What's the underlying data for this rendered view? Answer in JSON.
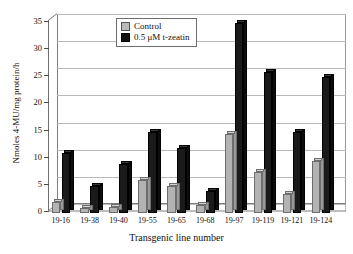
{
  "chart_data": {
    "type": "bar",
    "title": "",
    "xlabel": "Transgenic line number",
    "ylabel": "Nmoles 4-MU/mg protein/h",
    "ylim": [
      0,
      35
    ],
    "yticks": [
      0,
      5,
      10,
      15,
      20,
      25,
      30,
      35
    ],
    "grid": true,
    "legend_position": "top-center",
    "categories": [
      "19-16",
      "19-38",
      "19-40",
      "19-55",
      "19-65",
      "19-68",
      "19-97",
      "19-119",
      "19-121",
      "19-124"
    ],
    "series": [
      {
        "name": "Control",
        "color": "#b3b3b3",
        "values": [
          2.0,
          1.0,
          1.2,
          6.0,
          5.0,
          1.5,
          14.5,
          7.5,
          3.5,
          9.5
        ]
      },
      {
        "name": "0.5 μM t-zeatin",
        "color": "#1a1a1a",
        "values": [
          11.0,
          5.0,
          9.0,
          15.0,
          12.0,
          4.0,
          35.0,
          26.0,
          15.0,
          25.0
        ]
      }
    ]
  },
  "legend": {
    "items": [
      {
        "label": "Control",
        "swatch": "control-swatch"
      },
      {
        "label": "0.5 μM t-zeatin",
        "swatch": "treatment-swatch"
      }
    ]
  },
  "axes": {
    "y_title": "Nmoles 4-MU/mg protein/h",
    "x_title": "Transgenic line number",
    "y_ticks": [
      "0",
      "5",
      "10",
      "15",
      "20",
      "25",
      "30",
      "35"
    ],
    "x_ticks": [
      "19-16",
      "19-38",
      "19-40",
      "19-55",
      "19-65",
      "19-68",
      "19-97",
      "19-119",
      "19-121",
      "19-124"
    ]
  }
}
